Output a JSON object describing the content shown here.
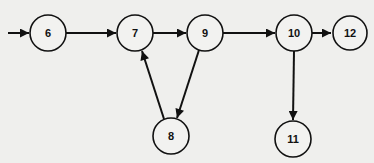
{
  "diagram": {
    "type": "directed-graph",
    "colors": {
      "background": "#efefed",
      "stroke": "#111111",
      "node_fill": "#f2f2f0"
    },
    "node_radius": 18,
    "nodes": [
      {
        "id": "6",
        "label": "6",
        "x": 48,
        "y": 33
      },
      {
        "id": "7",
        "label": "7",
        "x": 135,
        "y": 33
      },
      {
        "id": "9",
        "label": "9",
        "x": 205,
        "y": 33
      },
      {
        "id": "10",
        "label": "10",
        "x": 294,
        "y": 33
      },
      {
        "id": "12",
        "label": "12",
        "x": 350,
        "y": 33
      },
      {
        "id": "8",
        "label": "8",
        "x": 171,
        "y": 136
      },
      {
        "id": "11",
        "label": "11",
        "x": 293,
        "y": 139
      }
    ],
    "edges": [
      {
        "from": "entry",
        "to": "6"
      },
      {
        "from": "6",
        "to": "7"
      },
      {
        "from": "7",
        "to": "9"
      },
      {
        "from": "9",
        "to": "10"
      },
      {
        "from": "10",
        "to": "12"
      },
      {
        "from": "9",
        "to": "8"
      },
      {
        "from": "8",
        "to": "7"
      },
      {
        "from": "10",
        "to": "11"
      }
    ]
  }
}
